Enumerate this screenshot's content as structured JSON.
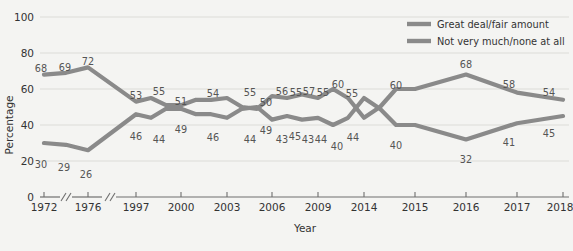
{
  "chart_data": {
    "type": "line",
    "title": "",
    "xlabel": "Year",
    "ylabel": "Percentage",
    "ylim": [
      0,
      100
    ],
    "yticks": [
      0,
      20,
      40,
      60,
      80,
      100
    ],
    "grid": true,
    "legend_position": "top-right",
    "axis_breaks": [
      "after 1972",
      "after 1976"
    ],
    "x_tick_labels": [
      "1972",
      "1976",
      "1997",
      "2000",
      "2003",
      "2006",
      "2009",
      "2014",
      "2015",
      "2016",
      "2017",
      "2018"
    ],
    "x": [
      "1972",
      "1974",
      "1976",
      "1997",
      "1998",
      "1999",
      "2000",
      "2001",
      "2002",
      "2003",
      "2004",
      "2005",
      "2006",
      "2007",
      "2008",
      "2009",
      "2010",
      "2011",
      "2012",
      "2013",
      "2014",
      "2015",
      "2016",
      "2017",
      "2018"
    ],
    "series": [
      {
        "name": "Great deal/fair amount",
        "color": "#8a8a8a",
        "values": [
          68,
          69,
          72,
          53,
          55,
          51,
          51,
          54,
          54,
          55,
          50,
          49,
          56,
          55,
          57,
          55,
          60,
          55,
          44,
          50,
          60,
          60,
          68,
          58,
          54
        ],
        "labels": [
          "68",
          "69",
          "72",
          "53",
          "55",
          "51",
          "",
          "54",
          "",
          "55",
          "50",
          "49",
          "56",
          "55",
          "57",
          "55",
          "60",
          "55",
          "",
          "",
          "60",
          "",
          "68",
          "58",
          "54"
        ]
      },
      {
        "name": "Not very much/none at all",
        "color": "#8a8a8a",
        "values": [
          30,
          29,
          26,
          46,
          44,
          49,
          49,
          46,
          46,
          44,
          49,
          50,
          43,
          45,
          43,
          44,
          40,
          44,
          55,
          49,
          40,
          40,
          32,
          41,
          45
        ],
        "labels": [
          "30",
          "29",
          "26",
          "46",
          "44",
          "49",
          "",
          "46",
          "",
          "44",
          "49",
          "50",
          "43",
          "45",
          "43",
          "44",
          "40",
          "44",
          "",
          "",
          "40",
          "",
          "32",
          "41",
          "45"
        ]
      }
    ],
    "legend": [
      {
        "label": "Great deal/fair amount"
      },
      {
        "label": "Not very much/none at all"
      }
    ]
  },
  "axes": {
    "y_title": "Percentage",
    "x_title": "Year",
    "y_labels": [
      "100",
      "80",
      "60",
      "40",
      "20",
      "0"
    ],
    "x_labels": [
      "1972",
      "1976",
      "1997",
      "2000",
      "2003",
      "2006",
      "2009",
      "2014",
      "2015",
      "2016",
      "2017",
      "2018"
    ]
  },
  "point_labels": {
    "top": [
      {
        "text": "68",
        "x": 41,
        "y": 72
      },
      {
        "text": "69",
        "x": 65,
        "y": 71
      },
      {
        "text": "72",
        "x": 88,
        "y": 65
      },
      {
        "text": "53",
        "x": 136,
        "y": 99
      },
      {
        "text": "55",
        "x": 159,
        "y": 95
      },
      {
        "text": "51",
        "x": 181,
        "y": 105
      },
      {
        "text": "54",
        "x": 213,
        "y": 97
      },
      {
        "text": "55",
        "x": 250,
        "y": 96
      },
      {
        "text": "50",
        "x": 266,
        "y": 106
      },
      {
        "text": "56",
        "x": 282,
        "y": 95
      },
      {
        "text": "55",
        "x": 296,
        "y": 96
      },
      {
        "text": "57",
        "x": 309,
        "y": 95
      },
      {
        "text": "55",
        "x": 323,
        "y": 96
      },
      {
        "text": "60",
        "x": 338,
        "y": 88
      },
      {
        "text": "55",
        "x": 352,
        "y": 97
      },
      {
        "text": "60",
        "x": 396,
        "y": 89
      },
      {
        "text": "68",
        "x": 466,
        "y": 68
      },
      {
        "text": "58",
        "x": 509,
        "y": 88
      },
      {
        "text": "54",
        "x": 549,
        "y": 96
      }
    ],
    "bottom": [
      {
        "text": "30",
        "x": 41,
        "y": 168
      },
      {
        "text": "29",
        "x": 64,
        "y": 171
      },
      {
        "text": "26",
        "x": 86,
        "y": 178
      },
      {
        "text": "46",
        "x": 136,
        "y": 140
      },
      {
        "text": "44",
        "x": 159,
        "y": 143
      },
      {
        "text": "49",
        "x": 181,
        "y": 133
      },
      {
        "text": "46",
        "x": 213,
        "y": 141
      },
      {
        "text": "44",
        "x": 250,
        "y": 143
      },
      {
        "text": "49",
        "x": 266,
        "y": 134
      },
      {
        "text": "43",
        "x": 282,
        "y": 143
      },
      {
        "text": "45",
        "x": 295,
        "y": 140
      },
      {
        "text": "43",
        "x": 308,
        "y": 143
      },
      {
        "text": "44",
        "x": 321,
        "y": 143
      },
      {
        "text": "40",
        "x": 337,
        "y": 150
      },
      {
        "text": "44",
        "x": 353,
        "y": 141
      },
      {
        "text": "40",
        "x": 396,
        "y": 149
      },
      {
        "text": "32",
        "x": 466,
        "y": 163
      },
      {
        "text": "41",
        "x": 509,
        "y": 146
      },
      {
        "text": "45",
        "x": 549,
        "y": 137
      }
    ]
  }
}
